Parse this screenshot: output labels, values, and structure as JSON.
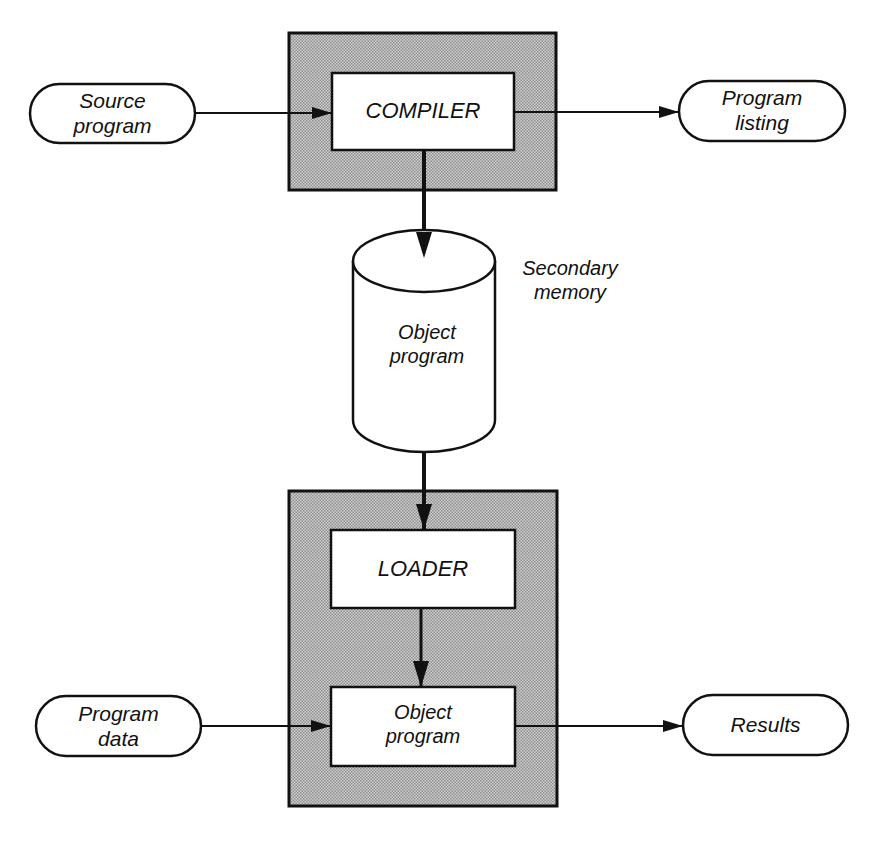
{
  "diagram": {
    "title": "",
    "colors": {
      "stroke": "#111111",
      "shaded_fill": "#b8b8b8",
      "box_fill": "#ffffff",
      "background": "#ffffff"
    },
    "nodes": {
      "source_program": {
        "lines": [
          "Source",
          "program"
        ],
        "shape": "terminal"
      },
      "compiler": {
        "lines": [
          "COMPILER"
        ],
        "shape": "process",
        "container": "shaded"
      },
      "program_listing": {
        "lines": [
          "Program",
          "listing"
        ],
        "shape": "terminal"
      },
      "object_program_storage": {
        "lines": [
          "Object",
          "program"
        ],
        "shape": "cylinder"
      },
      "secondary_memory_caption": {
        "lines": [
          "Secondary",
          "memory"
        ],
        "shape": "annotation"
      },
      "loader": {
        "lines": [
          "LOADER"
        ],
        "shape": "process",
        "container": "shaded"
      },
      "object_program_exec": {
        "lines": [
          "Object",
          "program"
        ],
        "shape": "process",
        "container": "shaded"
      },
      "program_data": {
        "lines": [
          "Program",
          "data"
        ],
        "shape": "terminal"
      },
      "results": {
        "lines": [
          "Results"
        ],
        "shape": "terminal"
      }
    },
    "edges": [
      {
        "from": "source_program",
        "to": "compiler"
      },
      {
        "from": "compiler",
        "to": "program_listing"
      },
      {
        "from": "compiler",
        "to": "object_program_storage"
      },
      {
        "from": "object_program_storage",
        "to": "loader"
      },
      {
        "from": "loader",
        "to": "object_program_exec"
      },
      {
        "from": "program_data",
        "to": "object_program_exec"
      },
      {
        "from": "object_program_exec",
        "to": "results"
      }
    ]
  }
}
